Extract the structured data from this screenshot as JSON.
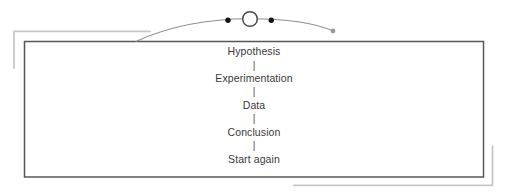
{
  "diagram": {
    "steps": [
      {
        "label": "Hypothesis"
      },
      {
        "label": "Experimentation"
      },
      {
        "label": "Data"
      },
      {
        "label": "Conclusion"
      },
      {
        "label": "Start again"
      }
    ],
    "separator": "|",
    "decorations": {
      "arc_nodes": [
        "black-dot",
        "open-circle",
        "black-dot",
        "gray-end-dot"
      ]
    }
  },
  "colors": {
    "background": "#ffffff",
    "box_border": "#56565a",
    "shadow": "#c7c7c9",
    "arc": "#8f8f8f",
    "circle_stroke": "#4a4a4a",
    "circle_fill": "#ffffff",
    "dot_black": "#141414",
    "dot_gray": "#9b9b9b",
    "text": "#3a3a3a"
  }
}
